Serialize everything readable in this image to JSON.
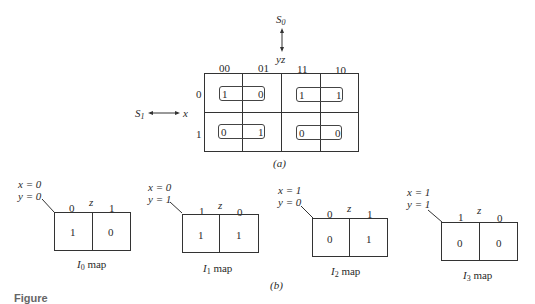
{
  "main_map": {
    "top_var_label": "S",
    "top_var_sub": "0",
    "top_axis_label": "yz",
    "left_var_label": "S",
    "left_var_sub": "1",
    "left_axis_label": "x",
    "col_headers": [
      "00",
      "01",
      "11",
      "10"
    ],
    "row_headers": [
      "0",
      "1"
    ],
    "cells": [
      [
        "1",
        "0",
        "1",
        "1"
      ],
      [
        "0",
        "1",
        "0",
        "0"
      ]
    ],
    "caption": "(a)"
  },
  "sub_maps": [
    {
      "x_label": "x = 0",
      "y_label": "y = 0",
      "z_label": "z",
      "col_headers": [
        "0",
        "1"
      ],
      "cells": [
        "1",
        "0"
      ],
      "caption_main": "I",
      "caption_sub": "0",
      "caption_suffix": " map"
    },
    {
      "x_label": "x = 0",
      "y_label": "y = 1",
      "z_label": "z",
      "col_headers": [
        "1",
        "0"
      ],
      "cells": [
        "1",
        "1"
      ],
      "caption_main": "I",
      "caption_sub": "1",
      "caption_suffix": " map"
    },
    {
      "x_label": "x = 1",
      "y_label": "y = 0",
      "z_label": "z",
      "col_headers": [
        "0",
        "1"
      ],
      "cells": [
        "0",
        "1"
      ],
      "caption_main": "I",
      "caption_sub": "2",
      "caption_suffix": " map"
    },
    {
      "x_label": "x = 1",
      "y_label": "y = 1",
      "z_label": "z",
      "col_headers": [
        "1",
        "0"
      ],
      "cells": [
        "0",
        "0"
      ],
      "caption_main": "I",
      "caption_sub": "3",
      "caption_suffix": " map"
    }
  ],
  "part_b_caption": "(b)",
  "figure_label": "Figure"
}
